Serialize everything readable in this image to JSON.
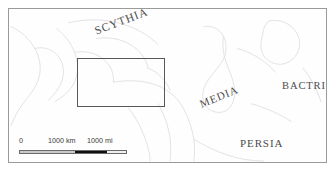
{
  "figure": {
    "type": "reference-map"
  },
  "map": {
    "background_color": "#fefefe",
    "neatline_color": "#9a9a9a",
    "coastline_color": "#e2e2e6",
    "label_color": "#4c4c4c",
    "region_labels": [
      {
        "id": "scythia",
        "text": "SCYTHIA",
        "rotation_deg": -21
      },
      {
        "id": "media",
        "text": "MEDIA",
        "rotation_deg": -22
      },
      {
        "id": "bactria",
        "text": "BACTRIA",
        "rotation_deg": 0
      },
      {
        "id": "persia",
        "text": "PERSIA",
        "rotation_deg": 0
      }
    ]
  },
  "inset_extent": {
    "label": "detail-extent-rectangle",
    "border_color": "#58585c"
  },
  "scale_bar": {
    "zero_label": "0",
    "km_label": "1000 km",
    "mi_label": "1000 mi",
    "light_segment_color": "#c9c9c9",
    "dark_segment_color": "#111111"
  }
}
